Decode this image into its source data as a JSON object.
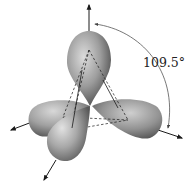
{
  "diagram": {
    "angle_label": "109.5°",
    "colors": {
      "background": "#ffffff",
      "lobe_light": "#d4d4d4",
      "lobe_mid": "#9a9a9a",
      "lobe_dark": "#555555",
      "line": "#1a1a1a",
      "arc": "#444444"
    },
    "elements": {
      "lobes": [
        "top-lobe",
        "left-lobe",
        "right-lobe",
        "front-lobe"
      ],
      "axes": [
        "top-axis-arrow",
        "left-axis-arrow",
        "right-axis-arrow",
        "front-axis-arrow"
      ],
      "tetrahedron": "dashed-tetrahedron",
      "angle_arc": "angle-arc"
    }
  }
}
